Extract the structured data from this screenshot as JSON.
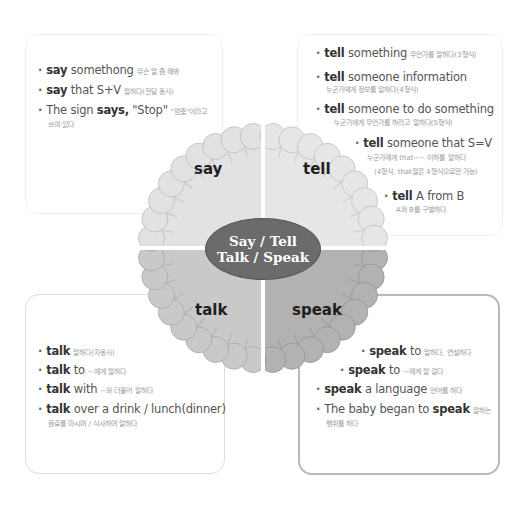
{
  "center": {
    "line1": "Say / Tell",
    "line2": "Talk / Speak"
  },
  "quadrants": {
    "say": {
      "label": "say",
      "color": "#e2e2e2"
    },
    "tell": {
      "label": "tell",
      "color": "#e6e6e6"
    },
    "talk": {
      "label": "talk",
      "color": "#c9c9c9"
    },
    "speak": {
      "label": "speak",
      "color": "#b2b2b2"
    }
  },
  "say_box": {
    "items": [
      {
        "bold": "say",
        "rest": " somethong",
        "ko": "무슨 말 좀 해봐"
      },
      {
        "bold": "say",
        "rest": " that S+V",
        "ko": "말하다(전달 동사)"
      },
      {
        "pre": "The sign ",
        "bold": "says,",
        "rest": " \"Stop\"",
        "ko": "\"멈춤\"이라고",
        "sub": "쓰여 있다"
      }
    ]
  },
  "tell_box": {
    "items": [
      {
        "bold": "tell",
        "rest": " something",
        "ko": "무언가를 말하다(3형식)"
      },
      {
        "bold": "tell",
        "rest": " someone information",
        "sub": "누군가에게 정보를 말하다(4형식)"
      },
      {
        "bold": "tell",
        "rest": " someone to do something",
        "sub": "누군가에게 무언가를 하라고 말하다(5형식)"
      },
      {
        "bold": "tell",
        "rest": " someone that S=V",
        "sub": "누군가에게 that~~ 이하를 말하다",
        "sub2": "(4형식, that절은 4형식으로만 가능)"
      },
      {
        "bold": "tell",
        "rest": " A from B",
        "sub": "A와 B를 구별하다"
      }
    ]
  },
  "talk_box": {
    "items": [
      {
        "bold": "talk",
        "rest": "",
        "ko": "말하다(자동사)"
      },
      {
        "bold": "talk",
        "rest": " to",
        "ko": "~에게 말하다"
      },
      {
        "bold": "talk",
        "rest": " with",
        "ko": "~와 더불어 말하다"
      },
      {
        "bold": "talk",
        "rest": " over a drink / lunch(dinner)",
        "sub": "음료를 마시며 / 식사하며 말하다"
      }
    ]
  },
  "speak_box": {
    "items": [
      {
        "bold": "speak",
        "rest": " to",
        "ko": "말하다, 연설하다"
      },
      {
        "bold": "speak",
        "rest": " to",
        "ko": "~에게 말 걸다"
      },
      {
        "bold": "speak",
        "rest": " a language",
        "ko": "언어를 하다"
      },
      {
        "pre": "The baby began to ",
        "bold": "speak",
        "rest": "",
        "ko": "말하는",
        "sub": "행위를 하다"
      }
    ]
  }
}
